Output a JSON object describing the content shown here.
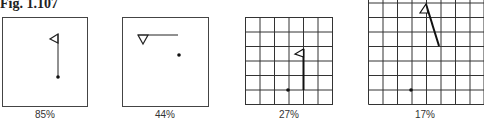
{
  "figure": {
    "title": "Fig. 1.107",
    "panels": [
      {
        "id": "p1",
        "label": "85%",
        "grid": false
      },
      {
        "id": "p2",
        "label": "44%",
        "grid": false
      },
      {
        "id": "p3",
        "label": "27%",
        "grid": true,
        "cells": 6
      },
      {
        "id": "p4",
        "label": "17%",
        "grid": true,
        "cells": 8
      }
    ]
  }
}
